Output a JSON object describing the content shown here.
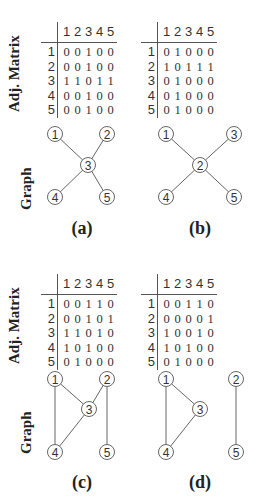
{
  "labels": {
    "matrix_axis": "Adj. Matrix",
    "graph_axis": "Graph"
  },
  "column_headers": [
    "1",
    "2",
    "3",
    "4",
    "5"
  ],
  "row_headers": [
    "1",
    "2",
    "3",
    "4",
    "5"
  ],
  "panels": [
    {
      "caption": "(a)",
      "matrix": [
        [
          "0",
          "0",
          "1",
          "0",
          "0"
        ],
        [
          "0",
          "0",
          "1",
          "0",
          "0"
        ],
        [
          "1",
          "1",
          "0",
          "1",
          "1"
        ],
        [
          "0",
          "0",
          "1",
          "0",
          "0"
        ],
        [
          "0",
          "0",
          "1",
          "0",
          "0"
        ]
      ],
      "nodes": [
        {
          "id": "1"
        },
        {
          "id": "2"
        },
        {
          "id": "3"
        },
        {
          "id": "4"
        },
        {
          "id": "5"
        }
      ],
      "edges": [
        [
          "1",
          "3"
        ],
        [
          "2",
          "3"
        ],
        [
          "3",
          "4"
        ],
        [
          "3",
          "5"
        ]
      ]
    },
    {
      "caption": "(b)",
      "matrix": [
        [
          "0",
          "1",
          "0",
          "0",
          "0"
        ],
        [
          "1",
          "0",
          "1",
          "1",
          "1"
        ],
        [
          "0",
          "1",
          "0",
          "0",
          "0"
        ],
        [
          "0",
          "1",
          "0",
          "0",
          "0"
        ],
        [
          "0",
          "1",
          "0",
          "0",
          "0"
        ]
      ],
      "nodes": [
        {
          "id": "1"
        },
        {
          "id": "3"
        },
        {
          "id": "2"
        },
        {
          "id": "4"
        },
        {
          "id": "5"
        }
      ],
      "edges": [
        [
          "1",
          "2"
        ],
        [
          "3",
          "2"
        ],
        [
          "2",
          "4"
        ],
        [
          "2",
          "5"
        ]
      ]
    },
    {
      "caption": "(c)",
      "matrix": [
        [
          "0",
          "0",
          "1",
          "1",
          "0"
        ],
        [
          "0",
          "0",
          "1",
          "0",
          "1"
        ],
        [
          "1",
          "1",
          "0",
          "1",
          "0"
        ],
        [
          "1",
          "0",
          "1",
          "0",
          "0"
        ],
        [
          "0",
          "1",
          "0",
          "0",
          "0"
        ]
      ],
      "nodes": [
        {
          "id": "1"
        },
        {
          "id": "2"
        },
        {
          "id": "3"
        },
        {
          "id": "4"
        },
        {
          "id": "5"
        }
      ],
      "edges": [
        [
          "1",
          "3"
        ],
        [
          "1",
          "4"
        ],
        [
          "2",
          "3"
        ],
        [
          "2",
          "5"
        ],
        [
          "3",
          "4"
        ]
      ]
    },
    {
      "caption": "(d)",
      "matrix": [
        [
          "0",
          "0",
          "1",
          "1",
          "0"
        ],
        [
          "0",
          "0",
          "0",
          "0",
          "1"
        ],
        [
          "1",
          "0",
          "0",
          "1",
          "0"
        ],
        [
          "1",
          "0",
          "1",
          "0",
          "0"
        ],
        [
          "0",
          "1",
          "0",
          "0",
          "0"
        ]
      ],
      "nodes": [
        {
          "id": "1"
        },
        {
          "id": "2"
        },
        {
          "id": "3"
        },
        {
          "id": "4"
        },
        {
          "id": "5"
        }
      ],
      "edges": [
        [
          "1",
          "3"
        ],
        [
          "1",
          "4"
        ],
        [
          "3",
          "4"
        ],
        [
          "2",
          "5"
        ]
      ]
    }
  ]
}
